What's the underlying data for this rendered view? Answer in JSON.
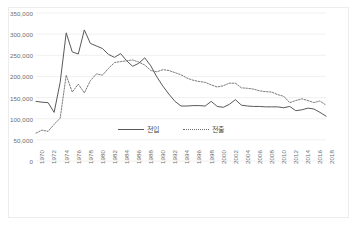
{
  "chart_data": {
    "type": "line",
    "title": "",
    "xlabel": "",
    "ylabel": "",
    "ylim": [
      0,
      350000
    ],
    "ytick_labels": [
      "0",
      "50,000",
      "100,000",
      "150,000",
      "200,000",
      "250,000",
      "300,000",
      "350,000"
    ],
    "ytick_values": [
      0,
      50000,
      100000,
      150000,
      200000,
      250000,
      300000,
      350000
    ],
    "grid": true,
    "legend_position": "inside-bottom-center",
    "x": [
      1970,
      1971,
      1972,
      1973,
      1974,
      1975,
      1976,
      1977,
      1978,
      1979,
      1980,
      1981,
      1982,
      1983,
      1984,
      1985,
      1986,
      1987,
      1988,
      1989,
      1990,
      1991,
      1992,
      1993,
      1994,
      1995,
      1996,
      1997,
      1998,
      1999,
      2000,
      2001,
      2002,
      2003,
      2004,
      2005,
      2006,
      2007,
      2008,
      2009,
      2010,
      2011,
      2012,
      2013,
      2014,
      2015,
      2016,
      2017,
      2018
    ],
    "xtick_labels": [
      "1970",
      "1972",
      "1974",
      "1976",
      "1978",
      "1980",
      "1982",
      "1984",
      "1986",
      "1988",
      "1990",
      "1992",
      "1994",
      "1996",
      "1998",
      "2000",
      "2002",
      "2004",
      "2006",
      "2008",
      "2010",
      "2012",
      "2014",
      "2016",
      "2018"
    ],
    "series": [
      {
        "name": "전입",
        "style": "solid",
        "color": "#595959",
        "values": [
          141000,
          139000,
          138000,
          115000,
          186000,
          303000,
          258000,
          253000,
          310000,
          278000,
          272000,
          266000,
          252000,
          245000,
          254000,
          237000,
          224000,
          231000,
          244000,
          225000,
          199000,
          177000,
          158000,
          141000,
          130000,
          130000,
          131000,
          131000,
          130000,
          141000,
          129000,
          127000,
          134000,
          145000,
          132000,
          130000,
          129000,
          129000,
          128000,
          128000,
          128000,
          126000,
          129000,
          119000,
          121000,
          125000,
          123000,
          115000,
          106000
        ]
      },
      {
        "name": "전출",
        "style": "dotted",
        "color": "#6b6b6b",
        "values": [
          66000,
          73000,
          70000,
          87000,
          101000,
          203000,
          163000,
          182000,
          161000,
          190000,
          206000,
          203000,
          219000,
          233000,
          235000,
          237000,
          239000,
          234000,
          227000,
          214000,
          211000,
          216000,
          214000,
          209000,
          204000,
          196000,
          191000,
          188000,
          186000,
          180000,
          175000,
          178000,
          184000,
          184000,
          173000,
          172000,
          170000,
          166000,
          164000,
          163000,
          157000,
          153000,
          138000,
          143000,
          147000,
          143000,
          138000,
          142000,
          132000
        ]
      }
    ]
  },
  "legend": {
    "items": [
      {
        "label": "전입",
        "style": "solid"
      },
      {
        "label": "전출",
        "style": "dotted"
      }
    ]
  }
}
